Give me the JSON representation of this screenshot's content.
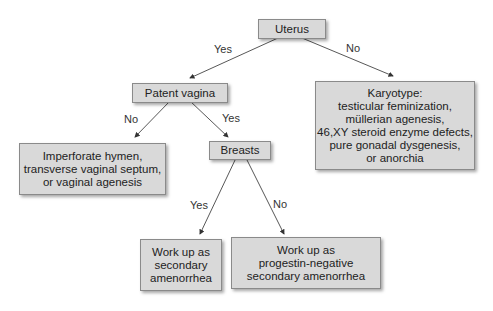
{
  "nodes": {
    "uterus": {
      "lines": [
        "Uterus"
      ]
    },
    "patent_vagina": {
      "lines": [
        "Patent vagina"
      ]
    },
    "karyotype": {
      "lines": [
        "Karyotype:",
        "testicular feminization,",
        "müllerian agenesis,",
        "46,XY steroid enzyme defects,",
        "pure gonadal dysgenesis,",
        "or anorchia"
      ]
    },
    "imperforate": {
      "lines": [
        "Imperforate hymen,",
        "transverse vaginal septum,",
        "or vaginal agenesis"
      ]
    },
    "breasts": {
      "lines": [
        "Breasts"
      ]
    },
    "secondary": {
      "lines": [
        "Work up as",
        "secondary",
        "amenorrhea"
      ]
    },
    "progestin": {
      "lines": [
        "Work up as",
        "progestin-negative",
        "secondary amenorrhea"
      ]
    }
  },
  "edges": {
    "uterus_yes": "Yes",
    "uterus_no": "No",
    "vagina_no": "No",
    "vagina_yes": "Yes",
    "breasts_yes": "Yes",
    "breasts_no": "No"
  }
}
